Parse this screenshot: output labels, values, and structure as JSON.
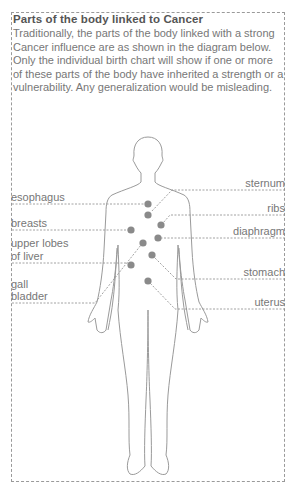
{
  "title": "Parts of the body linked to Cancer",
  "intro": "Traditionally, the parts of the body linked with a strong Cancer influence are as shown in the diagram below. Only the individual birth chart will show if one or more of these parts of the body have inherited a strength or a vulnerability. Any generalization would be misleading.",
  "labels": {
    "left": [
      {
        "text": "esophagus"
      },
      {
        "text": "breasts"
      },
      {
        "text": "upper lobes"
      },
      {
        "text": "of liver"
      },
      {
        "text": "gall"
      },
      {
        "text": "bladder"
      }
    ],
    "right": [
      {
        "text": "sternum"
      },
      {
        "text": "ribs"
      },
      {
        "text": "diaphragm"
      },
      {
        "text": "stomach"
      },
      {
        "text": "uterus"
      }
    ]
  },
  "colors": {
    "outline": "#9a9a9a",
    "dot": "#8a8a8a",
    "text": "#777777"
  }
}
